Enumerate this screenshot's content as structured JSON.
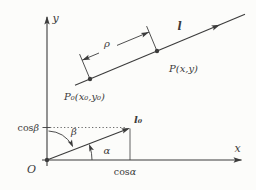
{
  "figure": {
    "colors": {
      "ink": "#3b3b3b",
      "background": "#fcfcfa"
    },
    "axes": {
      "x_label": "x",
      "y_label": "y",
      "origin_label": "O"
    },
    "line": {
      "label": "l",
      "point_label": "P(x,y)",
      "start_point_label": "P₀(x₀,y₀)",
      "distance_label": "ρ"
    },
    "unit_vector": {
      "label": "l₀",
      "angle_alpha": "α",
      "angle_beta": "β",
      "cos_prefix": "cos"
    }
  }
}
